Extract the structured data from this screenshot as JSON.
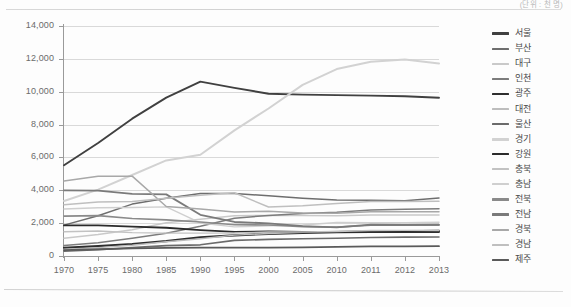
{
  "unit_note": "(단위 : 천 명)",
  "chart_data": {
    "type": "line",
    "title": "",
    "xlabel": "",
    "ylabel": "",
    "ylim": [
      0,
      14000
    ],
    "ytick_step": 2000,
    "ytick_labels": [
      "0",
      "2,000",
      "4,000",
      "6,000",
      "8,000",
      "10,000",
      "12,000",
      "14,000"
    ],
    "grid": true,
    "legend_position": "right",
    "categories": [
      "1970",
      "1975",
      "1980",
      "1985",
      "1990",
      "1995",
      "2000",
      "2005",
      "2010",
      "2011",
      "2012",
      "2013"
    ],
    "series": [
      {
        "name": "서울",
        "color": "#404040",
        "width": 1.9,
        "values": [
          5525,
          6880,
          8360,
          9640,
          10610,
          10230,
          9880,
          9820,
          9790,
          9760,
          9720,
          9630
        ]
      },
      {
        "name": "부산",
        "color": "#6e6e6e",
        "width": 1.5,
        "values": [
          1880,
          2450,
          3160,
          3510,
          3800,
          3810,
          3660,
          3520,
          3410,
          3390,
          3370,
          3530
        ]
      },
      {
        "name": "대구",
        "color": "#c9c9c9",
        "width": 1.5,
        "values": [
          1080,
          1310,
          1600,
          2030,
          2230,
          2450,
          2470,
          2460,
          2450,
          2500,
          2500,
          2500
        ]
      },
      {
        "name": "인천",
        "color": "#7c7c7c",
        "width": 1.5,
        "values": [
          640,
          800,
          1080,
          1390,
          1810,
          2300,
          2470,
          2590,
          2660,
          2800,
          2840,
          2880
        ]
      },
      {
        "name": "광주",
        "color": "#2e2e2e",
        "width": 2.2,
        "values": [
          500,
          600,
          730,
          910,
          1140,
          1260,
          1350,
          1410,
          1450,
          1460,
          1470,
          1470
        ]
      },
      {
        "name": "대전",
        "color": "#bdbdbd",
        "width": 1.4,
        "values": [
          410,
          510,
          650,
          870,
          1050,
          1270,
          1370,
          1440,
          1500,
          1520,
          1530,
          1530
        ]
      },
      {
        "name": "울산",
        "color": "#6b6b6b",
        "width": 1.6,
        "values": [
          290,
          380,
          510,
          630,
          680,
          950,
          1010,
          1050,
          1080,
          1130,
          1150,
          1160
        ]
      },
      {
        "name": "경기",
        "color": "#d2d2d2",
        "width": 2.0,
        "values": [
          3350,
          4040,
          4930,
          5820,
          6160,
          7650,
          8980,
          10420,
          11380,
          11820,
          11960,
          11720
        ]
      },
      {
        "name": "강원",
        "color": "#2b2b2b",
        "width": 1.8,
        "values": [
          1860,
          1860,
          1790,
          1720,
          1580,
          1470,
          1490,
          1460,
          1470,
          1500,
          1520,
          1540
        ]
      },
      {
        "name": "충북",
        "color": "#c2c2c2",
        "width": 1.4,
        "values": [
          1480,
          1520,
          1420,
          1390,
          1390,
          1400,
          1460,
          1460,
          1490,
          1550,
          1560,
          1570
        ]
      },
      {
        "name": "충남",
        "color": "#cfcfcf",
        "width": 1.4,
        "values": [
          2860,
          2940,
          2950,
          2990,
          2010,
          1770,
          1840,
          1890,
          2040,
          2020,
          2030,
          2050
        ]
      },
      {
        "name": "전북",
        "color": "#8a8a8a",
        "width": 1.6,
        "values": [
          2430,
          2460,
          2280,
          2200,
          2070,
          1900,
          1890,
          1780,
          1760,
          1870,
          1870,
          1870
        ]
      },
      {
        "name": "전남",
        "color": "#7a7a7a",
        "width": 1.8,
        "values": [
          4000,
          3980,
          3780,
          3750,
          2510,
          2070,
          1990,
          1820,
          1740,
          1910,
          1900,
          1910
        ]
      },
      {
        "name": "경북",
        "color": "#a8a8a8",
        "width": 1.5,
        "values": [
          4560,
          4860,
          4860,
          3010,
          2860,
          2680,
          2720,
          2610,
          2600,
          2700,
          2700,
          2700
        ]
      },
      {
        "name": "경남",
        "color": "#bfbfbf",
        "width": 1.5,
        "values": [
          3120,
          3280,
          3320,
          3520,
          3700,
          3850,
          2980,
          3060,
          3190,
          3310,
          3310,
          3330
        ]
      },
      {
        "name": "제주",
        "color": "#5a5a5a",
        "width": 1.8,
        "values": [
          360,
          410,
          460,
          490,
          510,
          510,
          510,
          530,
          560,
          580,
          590,
          600
        ]
      }
    ]
  },
  "axis": {
    "y_ticks": [
      "14,000",
      "12,000",
      "10,000",
      "8,000",
      "6,000",
      "4,000",
      "2,000",
      "0"
    ],
    "x_ticks": [
      "1970",
      "1975",
      "1980",
      "1985",
      "1990",
      "1995",
      "2000",
      "2005",
      "2010",
      "2011",
      "2012",
      "2013"
    ]
  }
}
